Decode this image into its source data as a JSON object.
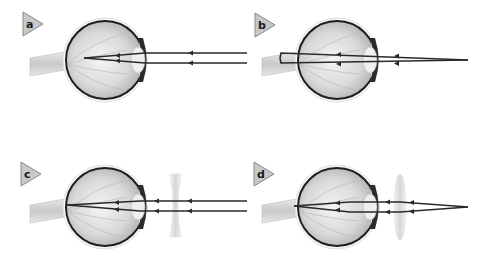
{
  "figure": {
    "panels": [
      {
        "label": "a",
        "description": "Parallel rays focus in front of retina (myopia)",
        "lens": "none"
      },
      {
        "label": "b",
        "description": "Converging rays focus behind retina (hyperopia)",
        "lens": "none"
      },
      {
        "label": "c",
        "description": "Concave lens corrects myopia",
        "lens": "concave"
      },
      {
        "label": "d",
        "description": "Convex lens corrects hyperopia",
        "lens": "convex"
      }
    ]
  },
  "colors": {
    "background": "#ffffff",
    "ray": "#2a2a2a",
    "eye_outline": "#1e1e1e",
    "eye_fill": "#d8d8d8",
    "label_fill": "#c8c8c8",
    "lens": "#e4e4e4"
  }
}
